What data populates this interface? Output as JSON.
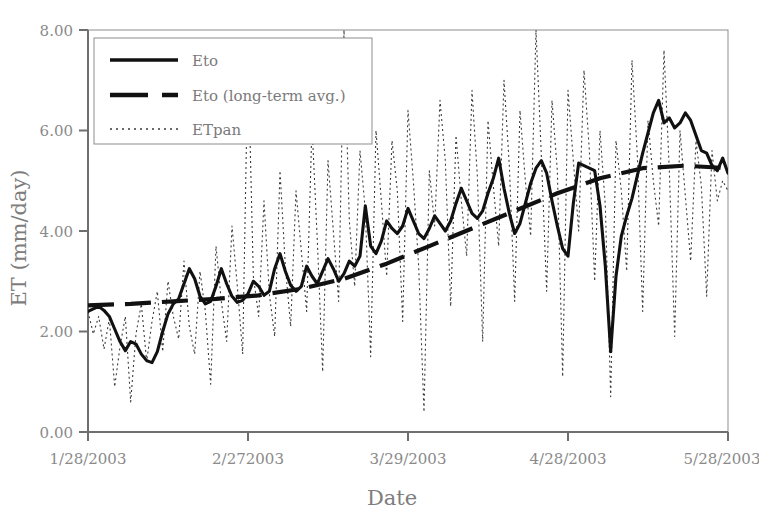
{
  "chart_data": {
    "type": "line",
    "title": "",
    "xlabel": "Date",
    "ylabel": "ET (mm/day)",
    "ylim": [
      0.0,
      8.0
    ],
    "yticks": [
      "0.00",
      "2.00",
      "4.00",
      "6.00",
      "8.00"
    ],
    "ytick_values": [
      0.0,
      2.0,
      4.0,
      6.0,
      8.0
    ],
    "xticks": [
      "1/28/2003",
      "2/272003",
      "3/29/2003",
      "4/28/2003",
      "5/28/2003"
    ],
    "xtick_days": [
      0,
      30,
      60,
      90,
      120
    ],
    "xlim_days": [
      0,
      120
    ],
    "grid": false,
    "legend_position": "upper-left-inside",
    "plot_border": true,
    "line_color": "#1a1a1a",
    "axis_color": "#6f6f6f",
    "background": "#ffffff",
    "series": [
      {
        "name": "Eto",
        "style": "solid",
        "x": [
          0,
          1,
          2,
          3,
          4,
          5,
          6,
          7,
          8,
          9,
          10,
          11,
          12,
          13,
          14,
          15,
          16,
          17,
          18,
          19,
          20,
          21,
          22,
          23,
          24,
          25,
          26,
          27,
          28,
          29,
          30,
          31,
          32,
          33,
          34,
          35,
          36,
          37,
          38,
          39,
          40,
          41,
          42,
          43,
          44,
          45,
          46,
          47,
          48,
          49,
          50,
          51,
          52,
          53,
          54,
          55,
          56,
          57,
          58,
          59,
          60,
          61,
          62,
          63,
          64,
          65,
          66,
          67,
          68,
          69,
          70,
          71,
          72,
          73,
          74,
          75,
          76,
          77,
          78,
          79,
          80,
          81,
          82,
          83,
          84,
          85,
          86,
          87,
          88,
          89,
          90,
          91,
          92,
          93,
          94,
          95,
          96,
          97,
          98,
          99,
          100,
          101,
          102,
          103,
          104,
          105,
          106,
          107,
          108,
          109,
          110,
          111,
          112,
          113,
          114,
          115,
          116,
          117,
          118,
          119,
          120
        ],
        "values": [
          2.4,
          2.45,
          2.5,
          2.42,
          2.3,
          2.05,
          1.8,
          1.62,
          1.8,
          1.75,
          1.55,
          1.42,
          1.38,
          1.6,
          2.0,
          2.35,
          2.55,
          2.65,
          2.95,
          3.25,
          3.05,
          2.7,
          2.55,
          2.6,
          2.9,
          3.25,
          2.95,
          2.7,
          2.58,
          2.62,
          2.75,
          3.0,
          2.9,
          2.72,
          2.8,
          3.25,
          3.55,
          3.2,
          2.92,
          2.8,
          2.9,
          3.3,
          3.1,
          2.95,
          3.2,
          3.45,
          3.25,
          3.0,
          3.15,
          3.4,
          3.3,
          3.5,
          4.5,
          3.7,
          3.55,
          3.8,
          4.2,
          4.05,
          3.95,
          4.1,
          4.45,
          4.2,
          3.95,
          3.85,
          4.05,
          4.3,
          4.15,
          4.0,
          4.2,
          4.55,
          4.85,
          4.6,
          4.35,
          4.25,
          4.4,
          4.75,
          5.05,
          5.45,
          4.85,
          4.35,
          3.95,
          4.15,
          4.55,
          4.95,
          5.25,
          5.4,
          5.15,
          4.6,
          4.1,
          3.65,
          3.5,
          4.55,
          5.35,
          5.3,
          5.25,
          5.2,
          4.5,
          3.3,
          1.6,
          3.1,
          3.9,
          4.3,
          4.65,
          5.1,
          5.55,
          5.95,
          6.35,
          6.6,
          6.15,
          6.25,
          6.05,
          6.15,
          6.35,
          6.2,
          5.9,
          5.6,
          5.55,
          5.3,
          5.2,
          5.45,
          5.15
        ],
        "notes": "Daily reference evapotranspiration (Eto), thick solid black line, rising trend from ~2.4 to ~5.5 mm/day"
      },
      {
        "name": "Eto (long-term avg.)",
        "style": "dashed",
        "x": [
          0,
          8,
          16,
          24,
          32,
          40,
          48,
          56,
          64,
          72,
          80,
          88,
          96,
          104,
          112,
          120
        ],
        "values": [
          2.52,
          2.55,
          2.6,
          2.65,
          2.72,
          2.85,
          3.05,
          3.35,
          3.7,
          4.05,
          4.4,
          4.75,
          5.05,
          5.25,
          5.3,
          5.25
        ],
        "notes": "Long-term average Eto, thick dashed black line, smooth monotonic rise with plateau near 5.25"
      },
      {
        "name": "ETpan",
        "style": "dotted",
        "x": [
          0,
          1,
          2,
          3,
          4,
          5,
          6,
          7,
          8,
          9,
          10,
          11,
          12,
          13,
          14,
          15,
          16,
          17,
          18,
          19,
          20,
          21,
          22,
          23,
          24,
          25,
          26,
          27,
          28,
          29,
          30,
          31,
          32,
          33,
          34,
          35,
          36,
          37,
          38,
          39,
          40,
          41,
          42,
          43,
          44,
          45,
          46,
          47,
          48,
          49,
          50,
          51,
          52,
          53,
          54,
          55,
          56,
          57,
          58,
          59,
          60,
          61,
          62,
          63,
          64,
          65,
          66,
          67,
          68,
          69,
          70,
          71,
          72,
          73,
          74,
          75,
          76,
          77,
          78,
          79,
          80,
          81,
          82,
          83,
          84,
          85,
          86,
          87,
          88,
          89,
          90,
          91,
          92,
          93,
          94,
          95,
          96,
          97,
          98,
          99,
          100,
          101,
          102,
          103,
          104,
          105,
          106,
          107,
          108,
          109,
          110,
          111,
          112,
          113,
          114,
          115,
          116,
          117,
          118,
          119,
          120
        ],
        "values": [
          2.4,
          1.95,
          2.3,
          1.65,
          2.25,
          0.9,
          1.7,
          2.3,
          0.6,
          1.95,
          2.55,
          1.4,
          2.2,
          2.8,
          1.6,
          3.0,
          2.3,
          1.85,
          3.4,
          2.1,
          1.55,
          3.2,
          2.4,
          0.95,
          3.7,
          2.6,
          1.8,
          4.1,
          2.9,
          1.55,
          7.5,
          3.1,
          2.3,
          4.6,
          2.75,
          1.9,
          5.2,
          3.3,
          2.1,
          4.8,
          3.6,
          2.4,
          6.1,
          3.8,
          1.2,
          5.4,
          4.0,
          2.6,
          8.0,
          4.2,
          2.9,
          5.6,
          4.4,
          1.5,
          6.0,
          4.6,
          3.1,
          5.8,
          4.8,
          2.2,
          6.4,
          5.0,
          3.3,
          0.4,
          5.2,
          4.1,
          6.6,
          5.4,
          2.5,
          5.9,
          4.6,
          3.5,
          6.8,
          5.1,
          1.8,
          6.2,
          4.9,
          3.7,
          7.0,
          5.3,
          2.6,
          6.4,
          5.0,
          3.9,
          8.0,
          5.5,
          2.8,
          6.6,
          5.2,
          1.1,
          6.8,
          5.4,
          4.0,
          7.2,
          5.6,
          3.0,
          6.0,
          4.5,
          0.7,
          5.8,
          4.8,
          3.2,
          7.4,
          5.5,
          2.4,
          6.2,
          5.0,
          4.1,
          7.6,
          5.2,
          1.9,
          6.0,
          4.7,
          3.4,
          5.8,
          4.9,
          2.7,
          5.6,
          4.6,
          5.0,
          4.8
        ],
        "notes": "Pan evaporation ETpan, thin dotted line, very high variability with spikes up to and beyond 8.00 and dips below 1.00"
      }
    ]
  },
  "legend": {
    "items": [
      {
        "label": "Eto",
        "style": "solid"
      },
      {
        "label": "Eto (long-term avg.)",
        "style": "dashed"
      },
      {
        "label": "ETpan",
        "style": "dotted"
      }
    ]
  },
  "axes": {
    "y_title": "ET (mm/day)",
    "x_title": "Date",
    "y_tick_labels": [
      "8.00",
      "6.00",
      "4.00",
      "2.00",
      "0.00"
    ],
    "x_tick_labels": [
      "1/28/2003",
      "2/272003",
      "3/29/2003",
      "4/28/2003",
      "5/28/2003"
    ]
  }
}
